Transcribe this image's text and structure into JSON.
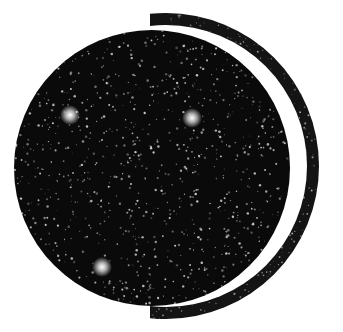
{
  "image": {
    "description": "Black star-filled disc with a thin crescent ring wrapping its right side",
    "background": "#ffffff",
    "disc": {
      "cx": 152,
      "cy": 168,
      "r": 138,
      "fill": "#0a0a0a"
    },
    "ring": {
      "cx": 166,
      "cy": 166,
      "r_outer": 153,
      "thickness": 12,
      "fill": "#141414"
    },
    "bright_stars": [
      {
        "x": 70,
        "y": 115,
        "r": 5
      },
      {
        "x": 192,
        "y": 118,
        "r": 5
      },
      {
        "x": 102,
        "y": 267,
        "r": 5
      }
    ],
    "star_color": "#e8e8e8"
  }
}
